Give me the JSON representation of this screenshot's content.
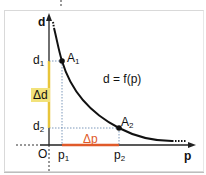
{
  "diagram": {
    "axes": {
      "y_label": "d",
      "x_label": "p",
      "origin_label": "O"
    },
    "equation": "d = f(p)",
    "points": [
      {
        "name": "A",
        "sub": "1"
      },
      {
        "name": "A",
        "sub": "2"
      }
    ],
    "y_ticks": [
      {
        "name": "d",
        "sub": "1"
      },
      {
        "name": "d",
        "sub": "2"
      }
    ],
    "x_ticks": [
      {
        "name": "p",
        "sub": "1"
      },
      {
        "name": "p",
        "sub": "2"
      }
    ],
    "delta_d": "Δd",
    "delta_p": "Δp",
    "colors": {
      "axis": "#222222",
      "curve": "#111111",
      "delta_d": "#e8c53a",
      "delta_d_bg": "#f2e27a",
      "delta_p": "#e05a2a",
      "guides": "#5a7ea8"
    }
  }
}
